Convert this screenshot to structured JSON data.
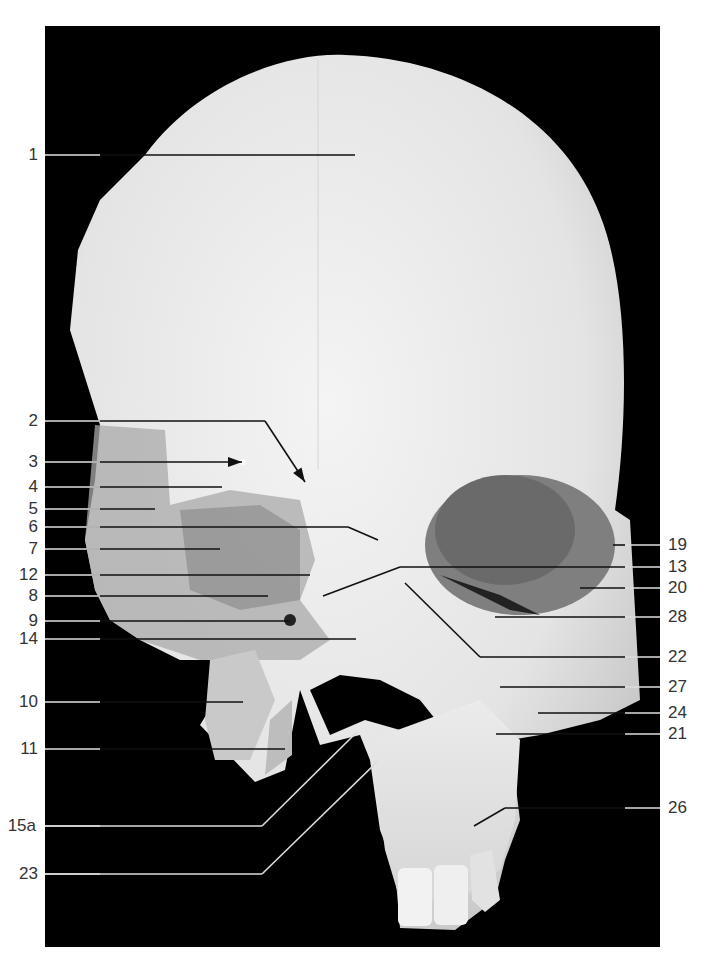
{
  "figure": {
    "background": "#000000",
    "bone_color": "#e9e9e9",
    "leader_color_on_bone": "#111111",
    "leader_color_on_background": "#dddddd",
    "label_color": "#333333"
  },
  "labels_left": [
    {
      "id": "1",
      "y": 155,
      "tx": 355,
      "ty": 155,
      "kind": "line"
    },
    {
      "id": "2",
      "y": 421,
      "tx": 305,
      "ty": 482,
      "kind": "bent-arrow",
      "bx": 265
    },
    {
      "id": "3",
      "y": 462,
      "tx": 242,
      "ty": 462,
      "kind": "arrow"
    },
    {
      "id": "4",
      "y": 487,
      "tx": 222,
      "ty": 487,
      "kind": "line"
    },
    {
      "id": "5",
      "y": 509,
      "tx": 155,
      "ty": 509,
      "kind": "line"
    },
    {
      "id": "6",
      "y": 527,
      "tx": 378,
      "ty": 540,
      "kind": "bent",
      "bx": 348
    },
    {
      "id": "7",
      "y": 549,
      "tx": 220,
      "ty": 549,
      "kind": "line"
    },
    {
      "id": "12",
      "y": 575,
      "tx": 310,
      "ty": 575,
      "kind": "line"
    },
    {
      "id": "8",
      "y": 596,
      "tx": 268,
      "ty": 596,
      "kind": "line"
    },
    {
      "id": "9",
      "y": 621,
      "tx": 290,
      "ty": 621,
      "kind": "line"
    },
    {
      "id": "14",
      "y": 639,
      "tx": 356,
      "ty": 639,
      "kind": "line"
    },
    {
      "id": "10",
      "y": 702,
      "tx": 243,
      "ty": 702,
      "kind": "line"
    },
    {
      "id": "11",
      "y": 749,
      "tx": 285,
      "ty": 749,
      "kind": "line"
    },
    {
      "id": "15a",
      "y": 826,
      "tx": 357,
      "ty": 732,
      "kind": "bent",
      "bx": 262
    },
    {
      "id": "23",
      "y": 874,
      "tx": 378,
      "ty": 761,
      "kind": "bent",
      "bx": 262
    }
  ],
  "labels_right": [
    {
      "id": "19",
      "y": 545,
      "tx": 613,
      "ty": 545,
      "kind": "line"
    },
    {
      "id": "13",
      "y": 567,
      "tx": 323,
      "ty": 596,
      "kind": "bent",
      "bx": 400
    },
    {
      "id": "20",
      "y": 588,
      "tx": 580,
      "ty": 588,
      "kind": "line"
    },
    {
      "id": "28",
      "y": 617,
      "tx": 495,
      "ty": 617,
      "kind": "line"
    },
    {
      "id": "22",
      "y": 657,
      "tx": 405,
      "ty": 583,
      "kind": "bent",
      "bx": 480
    },
    {
      "id": "27",
      "y": 687,
      "tx": 500,
      "ty": 687,
      "kind": "line"
    },
    {
      "id": "24",
      "y": 713,
      "tx": 538,
      "ty": 713,
      "kind": "line"
    },
    {
      "id": "21",
      "y": 734,
      "tx": 496,
      "ty": 734,
      "kind": "line"
    },
    {
      "id": "26",
      "y": 808,
      "tx": 474,
      "ty": 826,
      "kind": "bent",
      "bx": 505
    }
  ]
}
